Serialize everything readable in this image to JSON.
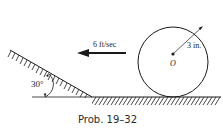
{
  "diagram": {
    "velocity_label": "6 ft/sec",
    "radius_label": "3 in.",
    "center_label": "O",
    "angle_label": "30°",
    "caption": "Prob. 19–32"
  },
  "colors": {
    "ink": "#1a1a1a",
    "background": "#ffffff"
  }
}
